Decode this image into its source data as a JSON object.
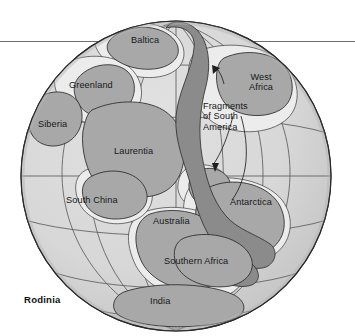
{
  "figure": {
    "caption": "Rodinia",
    "kind": "paleogeographic-globe",
    "projection": "orthographic"
  },
  "colors": {
    "background": "#ffffff",
    "ocean": "#d8d8d8",
    "ocean_shadow": "#c6c6c6",
    "continent": "#a8a8a8",
    "orogen": "#8b8b8b",
    "shelf": "#ececec",
    "outline": "#2b2b2b",
    "graticule": "#5d5d5d",
    "rule": "#6e6e6e",
    "text": "#17181a"
  },
  "labels": [
    {
      "id": "baltica",
      "text": "Baltica",
      "x": 131,
      "y": 35
    },
    {
      "id": "greenland",
      "text": "Greenland",
      "x": 69,
      "y": 80
    },
    {
      "id": "west-africa",
      "text": "West\nAfrica",
      "line1": "West",
      "line2": "Africa",
      "x": 249,
      "y": 72
    },
    {
      "id": "siberia",
      "text": "Siberia",
      "x": 38,
      "y": 119
    },
    {
      "id": "fragments-of-south-america",
      "text": "Fragments of South America",
      "line1": "Fragments",
      "line2": "of South",
      "line3": "America",
      "x": 203,
      "y": 101
    },
    {
      "id": "laurentia",
      "text": "Laurentia",
      "x": 114,
      "y": 146
    },
    {
      "id": "south-china",
      "text": "South China",
      "x": 66,
      "y": 195
    },
    {
      "id": "australia",
      "text": "Australia",
      "x": 153,
      "y": 216
    },
    {
      "id": "antarctica",
      "text": "Antarctica",
      "x": 230,
      "y": 197
    },
    {
      "id": "southern-africa",
      "text": "Southern Africa",
      "x": 164,
      "y": 256
    },
    {
      "id": "india",
      "text": "India",
      "x": 150,
      "y": 296
    }
  ],
  "annotations": {
    "leader_arrow_count": 2,
    "leader_targets": [
      "north-fragment",
      "south-fragment"
    ]
  }
}
